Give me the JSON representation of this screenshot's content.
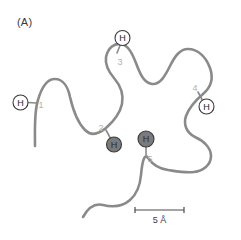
{
  "figure": {
    "panel_label": "(A)",
    "type": "polypeptide-chain-diagram",
    "chain_color": "#8a8a8a",
    "chain_width": 2.6,
    "label_color": "#b0b0b0",
    "open_marker_fill": "#ffffff",
    "filled_marker_fill": "#7b7b7b",
    "marker_stroke": "#3a3a3a",
    "marker_text_color": "#2b2b2b",
    "background": "#ffffff"
  },
  "residue_labels": [
    {
      "id": "1",
      "text": "1",
      "x": 41,
      "y": 108
    },
    {
      "id": "2",
      "text": "2",
      "x": 101,
      "y": 131
    },
    {
      "id": "3",
      "text": "3",
      "x": 120,
      "y": 65
    },
    {
      "id": "4",
      "text": "4",
      "x": 195,
      "y": 91
    },
    {
      "id": "5",
      "text": "5",
      "x": 150,
      "y": 162
    }
  ],
  "hydrogen_markers": [
    {
      "id": "h1",
      "text": "H",
      "style": "open",
      "cx": 20.5,
      "cy": 102.5,
      "r": 7.5,
      "tether": {
        "x1": 28,
        "y1": 102.5,
        "x2": 36,
        "y2": 103
      }
    },
    {
      "id": "h2",
      "text": "H",
      "style": "filled",
      "cx": 114,
      "cy": 144.5,
      "r": 7.5,
      "tether": {
        "x1": 110,
        "y1": 137.5,
        "x2": 106,
        "y2": 130
      }
    },
    {
      "id": "h3",
      "text": "H",
      "style": "open",
      "cx": 122.5,
      "cy": 38,
      "r": 7.5,
      "tether": {
        "x1": 120,
        "y1": 45.5,
        "x2": 117,
        "y2": 53
      }
    },
    {
      "id": "h4",
      "text": "H",
      "style": "open",
      "cx": 206.5,
      "cy": 106.5,
      "r": 7.5,
      "tether": {
        "x1": 202,
        "y1": 99.5,
        "x2": 198,
        "y2": 92
      }
    },
    {
      "id": "h5",
      "text": "H",
      "style": "filled",
      "cx": 146,
      "cy": 139,
      "r": 8,
      "tether": {
        "x1": 146,
        "y1": 147,
        "x2": 146,
        "y2": 155
      }
    }
  ],
  "chain_path": "M 35 146 C 35 128 34 112 38 100 C 42 86 48 79 55 79 C 63 79 68 87 70 97 C 73 110 77 122 85 130 C 92 137 100 133 106 128 C 114 121 120 113 122 104 C 124 94 120 85 114 78 C 108 71 105 64 106 57 C 108 48 114 43 121 44 C 128 45 132 53 136 63 C 140 74 144 83 152 84 C 160 85 165 76 170 66 C 175 56 180 49 188 49 C 198 49 206 57 210 68 C 214 79 210 88 203 94 C 196 100 189 108 186 116 C 183 125 187 133 195 137 C 204 141 211 148 211 156 C 211 165 203 171 194 172 C 184 173 175 171 168 170 C 160 169 153 165 148 158 C 144 152 142 164 141 175 C 140 186 137 194 130 200 C 122 207 111 207 103 205 C 95 203 88 208 83 217",
  "scalebar": {
    "label": "5 Å",
    "x_left": 135,
    "x_right": 184,
    "y": 210,
    "tick_height": 6,
    "color": "#4a4a4a"
  }
}
